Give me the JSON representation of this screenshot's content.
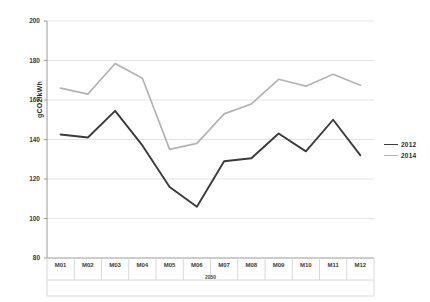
{
  "chart_data": {
    "type": "line",
    "title": "",
    "xlabel": "",
    "ylabel": "gCO2/kWh",
    "x_group_label": "2050",
    "categories": [
      "M01",
      "M02",
      "M03",
      "M04",
      "M05",
      "M06",
      "M07",
      "M08",
      "M09",
      "M10",
      "M11",
      "M12"
    ],
    "ylim": [
      80,
      200
    ],
    "ytick_values": [
      200,
      180,
      160,
      140,
      120,
      100,
      80
    ],
    "ytick_labels": [
      "200",
      "180",
      "160",
      "140",
      "120",
      "100",
      "80"
    ],
    "grid": true,
    "legend_position": "right",
    "series": [
      {
        "name": "2012",
        "color": "#3b3b3b",
        "values": [
          142.5,
          141.0,
          154.5,
          137.0,
          116.0,
          106.0,
          129.0,
          130.5,
          143.0,
          134.0,
          150.0,
          132.0
        ]
      },
      {
        "name": "2014",
        "color": "#b3b3b3",
        "values": [
          166.0,
          163.0,
          178.5,
          171.0,
          135.0,
          138.0,
          153.0,
          158.0,
          170.5,
          167.0,
          173.0,
          167.5
        ]
      }
    ]
  },
  "colors": {
    "series_2012": "#3b3b3b",
    "series_2014": "#b3b3b3",
    "gridline": "#e4e4e4",
    "axis": "#9a9a9a",
    "text": "#3a3a3a",
    "background": "#ffffff"
  }
}
